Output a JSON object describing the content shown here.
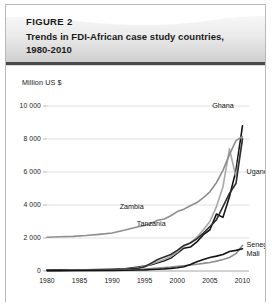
{
  "figure": {
    "label": "FIGURE 2",
    "title_line1": "Trends in FDI-African case study countries,",
    "title_line2": "1980-2010",
    "header_gradient_from": "#f4f4f4",
    "header_gradient_to": "#d4d4d4",
    "header_rule_color": "#4a4a4a",
    "border_color": "#b9b9b9"
  },
  "chart_data": {
    "type": "line",
    "title": "Trends in FDI-African case study countries, 1980-2010",
    "xlabel": "",
    "ylabel": "Million US $",
    "unit_label": "Million US $",
    "xlim": [
      1980,
      2011
    ],
    "ylim": [
      0,
      10000
    ],
    "xticks": [
      "1980",
      "1985",
      "1990",
      "1995",
      "2000",
      "2005",
      "2010"
    ],
    "xtick_values": [
      1980,
      1985,
      1990,
      1995,
      2000,
      2005,
      2010
    ],
    "yticks": [
      "0",
      "2 000",
      "4 000",
      "6 000",
      "8 000",
      "10 000"
    ],
    "ytick_values": [
      0,
      2000,
      4000,
      6000,
      8000,
      10000
    ],
    "grid": true,
    "legend": "inline-labels",
    "x": [
      1980,
      1982,
      1984,
      1986,
      1988,
      1990,
      1992,
      1994,
      1995,
      1996,
      1997,
      1998,
      1999,
      2000,
      2001,
      2002,
      2003,
      2004,
      2005,
      2006,
      2007,
      2008,
      2009,
      2010
    ],
    "series": [
      {
        "name": "Ghana",
        "color": "#141414",
        "label_x": 2007,
        "label_y": 9900,
        "values": [
          60,
          70,
          60,
          80,
          90,
          110,
          140,
          240,
          300,
          380,
          500,
          620,
          780,
          1080,
          1380,
          1450,
          1760,
          2200,
          2500,
          3450,
          3250,
          4500,
          6100,
          8800
        ]
      },
      {
        "name": "Uganda",
        "color": "#a8a8a8",
        "label_x": 2010,
        "label_y": 5900,
        "values": [
          20,
          20,
          25,
          30,
          40,
          60,
          110,
          190,
          280,
          420,
          560,
          700,
          880,
          1150,
          1500,
          1700,
          2050,
          2500,
          3000,
          3900,
          5100,
          7400,
          5700,
          8050
        ]
      },
      {
        "name": "Zambia",
        "color": "#8e8e8e",
        "label_x": 1993,
        "label_y": 3750,
        "values": [
          2050,
          2080,
          2100,
          2150,
          2220,
          2300,
          2480,
          2680,
          2760,
          2900,
          3080,
          3150,
          3350,
          3600,
          3750,
          3950,
          4150,
          4450,
          4800,
          5350,
          6100,
          7050,
          7900,
          8150
        ]
      },
      {
        "name": "Tanzania",
        "color": "#2e2e2e",
        "label_x": 1996,
        "label_y": 2750,
        "values": [
          40,
          45,
          50,
          55,
          60,
          70,
          100,
          160,
          260,
          480,
          700,
          850,
          1000,
          1250,
          1550,
          1700,
          1950,
          2300,
          2700,
          3100,
          3900,
          4700,
          5300,
          8000
        ]
      },
      {
        "name": "Senegal",
        "color": "#8e8e8e",
        "label_x": 2010,
        "label_y": 1450,
        "values": [
          30,
          30,
          35,
          40,
          45,
          55,
          70,
          95,
          120,
          150,
          180,
          210,
          240,
          280,
          320,
          360,
          410,
          460,
          520,
          600,
          700,
          820,
          1050,
          1550
        ]
      },
      {
        "name": "Mali",
        "color": "#141414",
        "label_x": 2010,
        "label_y": 900,
        "values": [
          25,
          25,
          30,
          30,
          35,
          40,
          50,
          60,
          70,
          90,
          110,
          130,
          160,
          200,
          260,
          400,
          560,
          700,
          820,
          900,
          1000,
          1180,
          1250,
          1350
        ]
      }
    ]
  }
}
